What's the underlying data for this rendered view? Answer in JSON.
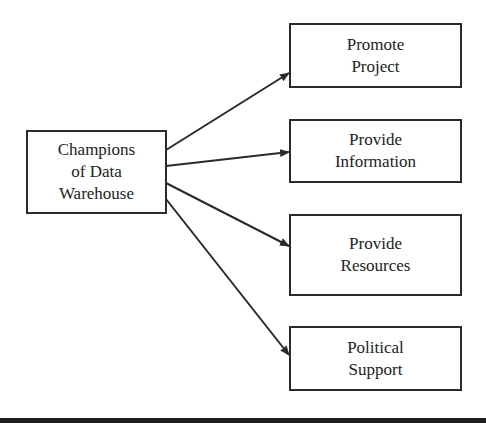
{
  "diagram": {
    "source": {
      "label": "Champions\nof Data\nWarehouse"
    },
    "targets": [
      {
        "label": "Promote\nProject"
      },
      {
        "label": "Provide\nInformation"
      },
      {
        "label": "Provide\nResources"
      },
      {
        "label": "Political\nSupport"
      }
    ],
    "colors": {
      "line": "#2a2a2a",
      "background": "#ffffff",
      "bottom_bar": "#1e1e1e"
    }
  }
}
